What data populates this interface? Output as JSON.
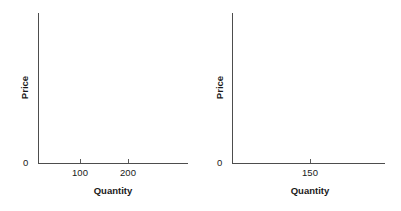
{
  "figure": {
    "background_color": "#ffffff",
    "axis_color": "#4d4d4d",
    "text_color": "#1a1a1a"
  },
  "chart_data": [
    {
      "type": "line",
      "panel": "left",
      "title": "",
      "xlabel": "Quantity",
      "ylabel": "Price",
      "origin_label": "0",
      "xticks": [
        100,
        200
      ],
      "xtick_labels": [
        "100",
        "200"
      ],
      "yticks": [],
      "ytick_labels": [],
      "series": [],
      "values": [],
      "x": [],
      "grid": false,
      "legend": false,
      "xlim": [
        0,
        280
      ],
      "ylim": [
        0,
        100
      ],
      "note": "empty axes, no data plotted"
    },
    {
      "type": "line",
      "panel": "right",
      "title": "",
      "xlabel": "Quantity",
      "ylabel": "Price",
      "origin_label": "0",
      "xticks": [
        150
      ],
      "xtick_labels": [
        "150"
      ],
      "yticks": [],
      "ytick_labels": [],
      "series": [],
      "values": [],
      "x": [],
      "grid": false,
      "legend": false,
      "xlim": [
        0,
        300
      ],
      "ylim": [
        0,
        100
      ],
      "note": "empty axes, no data plotted"
    }
  ],
  "panels": {
    "left": {
      "y_axis_title": "Price",
      "x_axis_title": "Quantity",
      "origin": "0",
      "x_tick_labels": [
        "100",
        "200"
      ]
    },
    "right": {
      "y_axis_title": "Price",
      "x_axis_title": "Quantity",
      "origin": "0",
      "x_tick_labels": [
        "150"
      ]
    }
  }
}
